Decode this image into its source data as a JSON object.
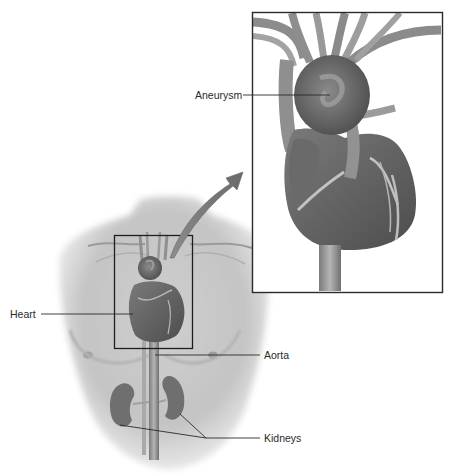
{
  "diagram": {
    "labels": {
      "aneurysm": "Aneurysm",
      "heart": "Heart",
      "aorta": "Aorta",
      "kidneys": "Kidneys"
    },
    "colors": {
      "background": "#ffffff",
      "line": "#2a2a2a",
      "frame": "#222222",
      "tissue": "#6e6e6e",
      "tissue_dark": "#4f4f4f",
      "tissue_light": "#9a9a9a",
      "skin": "#d4d4d4"
    }
  }
}
